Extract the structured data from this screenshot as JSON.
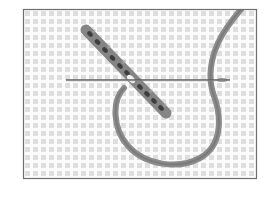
{
  "figure": {
    "colors": {
      "background": "#ffffff",
      "frame": "#6e6e6e",
      "canvas_bg": "#f6f6f6",
      "canvas_hole": "#dcdcdc",
      "canvas_thread": "#fbfbfb",
      "needle": "#5a5a5a",
      "yarn": "#8a8a8a",
      "yarn_dark": "#555555",
      "stitch": "#7a7a7a",
      "stitch_dark": "#3c3c3c"
    },
    "frame": {
      "x": 23,
      "y": 9,
      "width": 234,
      "height": 170
    },
    "grid_pitch": 8,
    "needle": {
      "x1": 66,
      "x2": 230,
      "y": 80
    },
    "stitch_band": {
      "x1": 86,
      "y1": 30,
      "x2": 166,
      "y2": 113,
      "count": 11
    }
  }
}
